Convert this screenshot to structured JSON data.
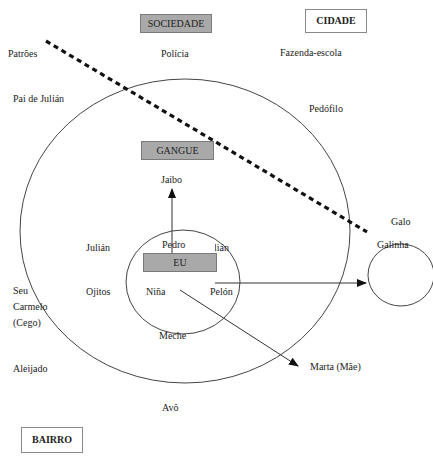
{
  "boxes": {
    "sociedade": "SOCIEDADE",
    "cidade": "CIDADE",
    "gangue": "GANGUE",
    "eu": "EU",
    "bairro": "BAIRRO"
  },
  "labels": {
    "patroes": "Patrões",
    "policia": "Polícia",
    "fazenda_escola": "Fazenda-escola",
    "pai_de_julian": "Pai de Julián",
    "pedofilo": "Pedófilo",
    "jaibo": "Jaibo",
    "julian_outer": "Julián",
    "pedro": "Pedro",
    "julian_inner": "Julián",
    "galo": "Galo",
    "galinha": "Galinha",
    "seu_carmelo_cego": "Seu\nCarmelo\n(Cego)",
    "ojitos": "Ojitos",
    "nina": "Niña",
    "pelon": "Pelón",
    "meche": "Meche",
    "aleijado": "Aleijado",
    "marta_mae": "Marta (Mãe)",
    "avo": "Avô"
  },
  "colors": {
    "grey_box": "#a9a9a9",
    "line": "#333333",
    "dashed_line": "#111111"
  }
}
